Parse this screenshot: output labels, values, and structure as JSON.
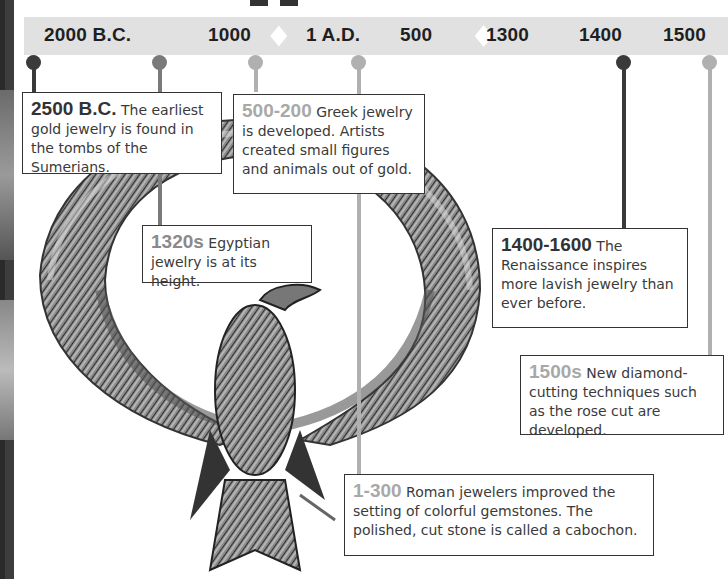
{
  "timeline": {
    "ticks": [
      {
        "label": "2000 B.C."
      },
      {
        "label": "1000"
      },
      {
        "label": "1 A.D."
      },
      {
        "label": "500"
      },
      {
        "label": "1300"
      },
      {
        "label": "1400"
      },
      {
        "label": "1500"
      }
    ]
  },
  "events": [
    {
      "year": "2500 B.C.",
      "text": " The earliest gold jewelry is found in the tombs of the Sumerians.",
      "tone": "dark"
    },
    {
      "year": "500-200",
      "text": " Greek jewelry is developed. Artists created small figures and animals out of gold.",
      "tone": "light"
    },
    {
      "year": "1320s",
      "text": " Egyptian jewelry is at its height.",
      "tone": "mid"
    },
    {
      "year": "1400-1600",
      "text": " The Renaissance inspires more lavish jewelry than ever before.",
      "tone": "dark"
    },
    {
      "year": "1500s",
      "text": " New diamond-cutting techniques such as the rose cut are developed.",
      "tone": "light"
    },
    {
      "year": "1-300",
      "text": " Roman jewelers improved the setting of colorful gemstones. The polished, cut stone is called a cabochon.",
      "tone": "light"
    }
  ],
  "colors": {
    "band": "#e1e1e1",
    "dark": "#3a3a3a",
    "mid": "#7a7a7a",
    "light": "#b0b0b0"
  },
  "image": {
    "subject": "Egyptian gold vulture collar with outstretched wings"
  }
}
